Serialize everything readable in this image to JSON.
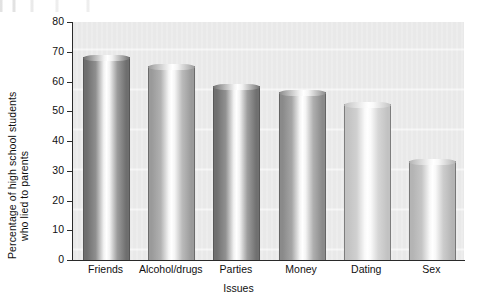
{
  "chart_data": {
    "type": "bar",
    "title": "",
    "xlabel": "Issues",
    "ylabel": "Percentage of high school students who lied to parents",
    "ylabel_lines": [
      "Percentage of high school students",
      "who lied to parents"
    ],
    "categories": [
      "Friends",
      "Alcohol/drugs",
      "Parties",
      "Money",
      "Dating",
      "Sex"
    ],
    "values": [
      68,
      65,
      58,
      56,
      52,
      33
    ],
    "ylim": [
      0,
      80
    ],
    "yticks": [
      0,
      10,
      20,
      30,
      40,
      50,
      60,
      70,
      80
    ],
    "ytick_labels": [
      "0",
      "10",
      "20",
      "30",
      "40",
      "50",
      "60",
      "70",
      "80"
    ],
    "grid": false,
    "legend": "none",
    "bar_style": "3d-cylinder-shaded-grayscale",
    "plot_background": "#e9e9e9",
    "axis_color": "#2a2a2a",
    "bar_shades": [
      {
        "category": "Friends",
        "dark": "#6e6e6e",
        "light": "#f2f2f2"
      },
      {
        "category": "Alcohol/drugs",
        "dark": "#9a9a9a",
        "light": "#f5f5f5"
      },
      {
        "category": "Parties",
        "dark": "#707070",
        "light": "#f2f2f2"
      },
      {
        "category": "Money",
        "dark": "#8a8a8a",
        "light": "#f4f4f4"
      },
      {
        "category": "Dating",
        "dark": "#c2c2c2",
        "light": "#fafafa"
      },
      {
        "category": "Sex",
        "dark": "#b4b4b4",
        "light": "#f8f8f8"
      }
    ]
  }
}
